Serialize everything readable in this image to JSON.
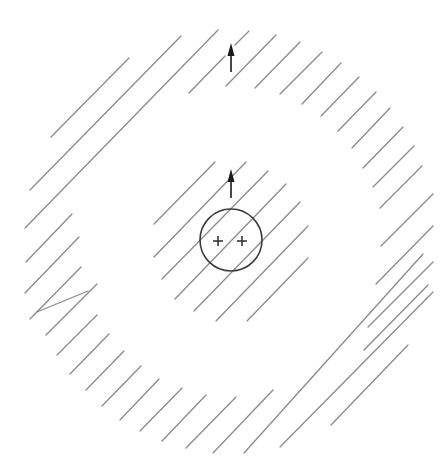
{
  "figure": {
    "colors": {
      "background": "#ffffff",
      "hatch": "#8a8a8a",
      "shell": "#3a3a3a",
      "arrow": "#1a1a1a"
    },
    "charges": [
      {
        "sign": "+",
        "label": "+"
      },
      {
        "sign": "+",
        "label": "+"
      }
    ],
    "arrows": [
      {
        "name": "inner-arrow",
        "direction": "up"
      },
      {
        "name": "outer-arrow",
        "direction": "up"
      }
    ],
    "regions": [
      {
        "name": "inner-hatched-region",
        "pattern": "diagonal-lines"
      },
      {
        "name": "outer-hatched-ring",
        "pattern": "diagonal-lines"
      }
    ]
  }
}
